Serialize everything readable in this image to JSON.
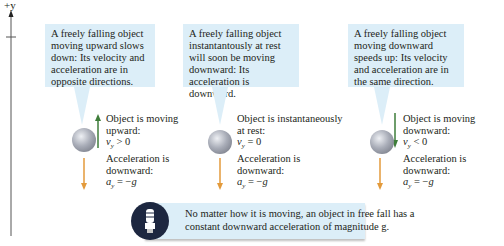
{
  "axis": {
    "label": "+y"
  },
  "panels": [
    {
      "callout": "A freely falling object moving upward slows down: Its velocity and acceleration are in opposite directions.",
      "velocity_caption": [
        "Object is moving",
        "upward:"
      ],
      "velocity_value": "v_y > 0",
      "velocity_direction": "up",
      "accel_caption": [
        "Acceleration is",
        "downward:"
      ],
      "accel_value": "a_y = -g"
    },
    {
      "callout": "A freely falling object instantantously at rest will soon be moving downward: Its acceleration is downward.",
      "velocity_caption": [
        "Object is instantaneously",
        "at rest:"
      ],
      "velocity_value": "v_y = 0",
      "velocity_direction": "none",
      "accel_caption": [
        "Acceleration is",
        "downward:"
      ],
      "accel_value": "a_y = -g"
    },
    {
      "callout": "A freely falling object moving downward speeds up: Its velocity and acceleration are in the same direction.",
      "velocity_caption": [
        "Object is moving",
        "downward:"
      ],
      "velocity_value": "v_y < 0",
      "velocity_direction": "down",
      "accel_caption": [
        "Acceleration is",
        "downward:"
      ],
      "accel_value": "a_y = -g"
    }
  ],
  "note": {
    "icon": "lightbulb-icon",
    "lines": [
      "No matter how it is moving, an object in free fall has a",
      "constant downward acceleration of magnitude g."
    ]
  },
  "colors": {
    "callout_bg": "#dceef8",
    "velocity_arrow": "#3e7d3a",
    "accel_arrow": "#e39a3b",
    "note_icon_bg": "#1d2740"
  }
}
